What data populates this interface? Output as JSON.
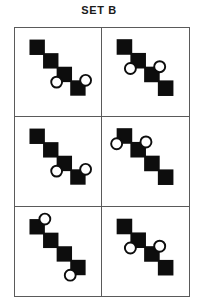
{
  "header": {
    "title": "SET B"
  },
  "colors": {
    "square_fill": "#0d0d0d",
    "circle_stroke": "#0d0d0d",
    "circle_fill": "#ffffff",
    "grid_line": "#5a5a5a",
    "background": "#ffffff",
    "title_text": "#1a1a1a"
  },
  "puzzle": {
    "type": "figure-matrix",
    "rows": 3,
    "columns": 2,
    "cell_count": 6,
    "square_size": 17,
    "step_x": 15,
    "step_y": 15,
    "circle_radius": 6,
    "cells": [
      {
        "index": 1,
        "position": "row1-col1",
        "squares": [
          {
            "x": 16,
            "y": 8
          },
          {
            "x": 31,
            "y": 23
          },
          {
            "x": 46,
            "y": 38
          },
          {
            "x": 61,
            "y": 53
          }
        ],
        "circles": [
          {
            "cx": 46,
            "cy": 55,
            "anchor": "square-3-bottom-left"
          },
          {
            "cx": 78,
            "cy": 53,
            "anchor": "square-4-top-right"
          }
        ]
      },
      {
        "index": 2,
        "position": "row1-col2",
        "squares": [
          {
            "x": 16,
            "y": 8
          },
          {
            "x": 31,
            "y": 23
          },
          {
            "x": 46,
            "y": 38
          },
          {
            "x": 61,
            "y": 53
          }
        ],
        "circles": [
          {
            "cx": 31,
            "cy": 40,
            "anchor": "square-2-bottom-left"
          },
          {
            "cx": 63,
            "cy": 38,
            "anchor": "square-3-top-right"
          }
        ]
      },
      {
        "index": 3,
        "position": "row2-col1",
        "squares": [
          {
            "x": 16,
            "y": 8
          },
          {
            "x": 31,
            "y": 23
          },
          {
            "x": 46,
            "y": 38
          },
          {
            "x": 61,
            "y": 53
          }
        ],
        "circles": [
          {
            "cx": 46,
            "cy": 55,
            "anchor": "square-3-bottom-left"
          },
          {
            "cx": 78,
            "cy": 53,
            "anchor": "square-4-top-right"
          }
        ]
      },
      {
        "index": 4,
        "position": "row2-col2",
        "squares": [
          {
            "x": 16,
            "y": 8
          },
          {
            "x": 31,
            "y": 23
          },
          {
            "x": 46,
            "y": 38
          },
          {
            "x": 61,
            "y": 53
          }
        ],
        "circles": [
          {
            "cx": 16,
            "cy": 25,
            "anchor": "square-1-bottom-left"
          },
          {
            "cx": 48,
            "cy": 23,
            "anchor": "square-2-top-right"
          }
        ]
      },
      {
        "index": 5,
        "position": "row3-col1",
        "squares": [
          {
            "x": 16,
            "y": 8
          },
          {
            "x": 31,
            "y": 23
          },
          {
            "x": 46,
            "y": 38
          },
          {
            "x": 61,
            "y": 53
          }
        ],
        "circles": [
          {
            "cx": 33,
            "cy": 8,
            "anchor": "square-1-top-right"
          },
          {
            "cx": 61,
            "cy": 70,
            "anchor": "square-4-bottom-left"
          }
        ]
      },
      {
        "index": 6,
        "position": "row3-col2",
        "squares": [
          {
            "x": 16,
            "y": 8
          },
          {
            "x": 31,
            "y": 23
          },
          {
            "x": 46,
            "y": 38
          },
          {
            "x": 61,
            "y": 53
          }
        ],
        "circles": [
          {
            "cx": 31,
            "cy": 40,
            "anchor": "square-2-bottom-left"
          },
          {
            "cx": 63,
            "cy": 38,
            "anchor": "square-3-top-right"
          }
        ]
      }
    ]
  }
}
